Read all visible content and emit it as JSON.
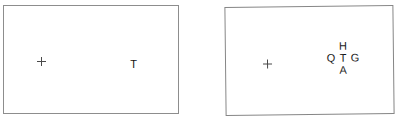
{
  "figure": {
    "width": 402,
    "height": 121,
    "background_color": "#ffffff"
  },
  "panels": [
    {
      "id": "uncrowded",
      "name": "uncrowded-panel",
      "border_color": "#8d8d8d",
      "background_color": "#ffffff",
      "fixation": {
        "symbol": "+",
        "name": "fixation-cross",
        "color": "#4a4a4a"
      },
      "stimulus": {
        "type": "single-target",
        "target_letter": "T",
        "target_color": "#141414",
        "flankers": []
      }
    },
    {
      "id": "crowded",
      "name": "crowded-panel",
      "border_color": "#868686",
      "background_color": "#ffffff",
      "fixation": {
        "symbol": "+",
        "name": "fixation-cross",
        "color": "#4a4a4a"
      },
      "stimulus": {
        "type": "flanked-target",
        "target_letter": "T",
        "target_color": "#141414",
        "flankers": [
          {
            "position": "top",
            "letter": "H"
          },
          {
            "position": "left",
            "letter": "Q"
          },
          {
            "position": "right",
            "letter": "G"
          },
          {
            "position": "bottom",
            "letter": "A"
          }
        ]
      }
    }
  ]
}
